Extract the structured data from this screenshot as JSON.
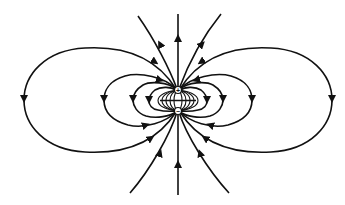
{
  "diagram": {
    "charges": [
      {
        "sign": "+",
        "label": "+",
        "x": 178,
        "y": 90
      },
      {
        "sign": "-",
        "label": "−",
        "x": 178,
        "y": 111
      }
    ],
    "field_line_color": "#111111",
    "background": "#ffffff",
    "outer_loops": 2,
    "inner_loops_per_side": 4,
    "vertical_lines": 3
  }
}
